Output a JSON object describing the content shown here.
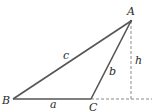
{
  "diagram": {
    "type": "triangle-with-altitude",
    "vertices": [
      {
        "label": "A",
        "x": 131,
        "y": 21
      },
      {
        "label": "B",
        "x": 13,
        "y": 99
      },
      {
        "label": "C",
        "x": 91,
        "y": 99
      }
    ],
    "sides": [
      {
        "label": "a",
        "from": "B",
        "to": "C"
      },
      {
        "label": "b",
        "from": "C",
        "to": "A"
      },
      {
        "label": "c",
        "from": "B",
        "to": "A"
      }
    ],
    "altitude": {
      "label": "h",
      "from": "A",
      "foot": {
        "x": 131,
        "y": 99
      },
      "style": "dashed"
    },
    "extension": {
      "from": "C",
      "to_x": 152,
      "style": "dashed"
    },
    "colors": {
      "line": "#555555",
      "dashed": "#8a8a8a",
      "text": "#2a2a2a"
    }
  },
  "labels": {
    "A": "A",
    "B": "B",
    "C": "C",
    "a": "a",
    "b": "b",
    "c": "c",
    "h": "h"
  }
}
